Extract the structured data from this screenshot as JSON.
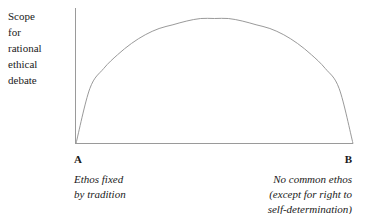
{
  "figure": {
    "background_color": "#ffffff",
    "line_color": "#9a9a9a",
    "text_color": "#1a1a1a"
  },
  "y_axis_caption": {
    "lines": [
      "Scope",
      "for",
      "rational",
      "ethical",
      "debate"
    ]
  },
  "endpoint_a": {
    "letter": "A",
    "description_lines": [
      "Ethos fixed",
      "by tradition"
    ]
  },
  "endpoint_b": {
    "letter": "B",
    "description_lines": [
      "No common ethos",
      "(except for right to",
      "self-determination)"
    ]
  },
  "chart_data": {
    "type": "line",
    "title": "",
    "xlabel": "",
    "ylabel": "Scope for rational ethical debate",
    "grid": false,
    "legend": "none",
    "axis_style": "open L-shape (left spine and bottom spine only, no ticks, no tick labels)",
    "xlim": [
      0,
      1
    ],
    "ylim": [
      0,
      1
    ],
    "x_endpoint_labels": [
      "A",
      "B"
    ],
    "annotations": [
      "A — Ethos fixed by tradition",
      "B — No common ethos (except for right to self-determination)"
    ],
    "series": [
      {
        "name": "Scope for rational ethical debate",
        "shape": "semicircular arch: zero at both endpoints A and B, maximum at midpoint",
        "x": [
          0.0,
          0.05,
          0.1,
          0.15,
          0.2,
          0.25,
          0.3,
          0.35,
          0.4,
          0.45,
          0.5,
          0.55,
          0.6,
          0.65,
          0.7,
          0.75,
          0.8,
          0.85,
          0.9,
          0.95,
          1.0
        ],
        "values": [
          0.0,
          0.44,
          0.6,
          0.71,
          0.8,
          0.87,
          0.92,
          0.95,
          0.98,
          1.0,
          1.0,
          1.0,
          0.98,
          0.95,
          0.92,
          0.87,
          0.8,
          0.71,
          0.6,
          0.44,
          0.0
        ]
      }
    ]
  }
}
